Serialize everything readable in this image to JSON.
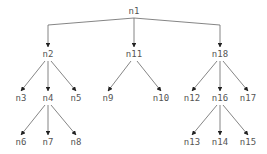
{
  "diagram": {
    "type": "tree",
    "colors": {
      "edge": "#666666",
      "label": "#555555",
      "background": "#ffffff"
    },
    "nodes": [
      {
        "id": "n1",
        "label": "n1",
        "x": 134,
        "y": 14
      },
      {
        "id": "n2",
        "label": "n2",
        "x": 48,
        "y": 57
      },
      {
        "id": "n11",
        "label": "n11",
        "x": 134,
        "y": 57
      },
      {
        "id": "n18",
        "label": "n18",
        "x": 220,
        "y": 57
      },
      {
        "id": "n3",
        "label": "n3",
        "x": 21,
        "y": 101
      },
      {
        "id": "n4",
        "label": "n4",
        "x": 48,
        "y": 101
      },
      {
        "id": "n5",
        "label": "n5",
        "x": 76,
        "y": 101
      },
      {
        "id": "n9",
        "label": "n9",
        "x": 108,
        "y": 101
      },
      {
        "id": "n10",
        "label": "n10",
        "x": 161,
        "y": 101
      },
      {
        "id": "n12",
        "label": "n12",
        "x": 192,
        "y": 101
      },
      {
        "id": "n16",
        "label": "n16",
        "x": 220,
        "y": 101
      },
      {
        "id": "n17",
        "label": "n17",
        "x": 248,
        "y": 101
      },
      {
        "id": "n6",
        "label": "n6",
        "x": 21,
        "y": 145
      },
      {
        "id": "n7",
        "label": "n7",
        "x": 48,
        "y": 145
      },
      {
        "id": "n8",
        "label": "n8",
        "x": 76,
        "y": 145
      },
      {
        "id": "n13",
        "label": "n13",
        "x": 192,
        "y": 145
      },
      {
        "id": "n14",
        "label": "n14",
        "x": 220,
        "y": 145
      },
      {
        "id": "n15",
        "label": "n15",
        "x": 248,
        "y": 145
      }
    ],
    "edges": [
      {
        "from": "n1",
        "to": "n2",
        "style": "elbow"
      },
      {
        "from": "n1",
        "to": "n11",
        "style": "straight"
      },
      {
        "from": "n1",
        "to": "n18",
        "style": "elbow"
      },
      {
        "from": "n2",
        "to": "n3"
      },
      {
        "from": "n2",
        "to": "n4"
      },
      {
        "from": "n2",
        "to": "n5"
      },
      {
        "from": "n4",
        "to": "n6"
      },
      {
        "from": "n4",
        "to": "n7"
      },
      {
        "from": "n4",
        "to": "n8"
      },
      {
        "from": "n11",
        "to": "n9"
      },
      {
        "from": "n11",
        "to": "n10"
      },
      {
        "from": "n18",
        "to": "n12"
      },
      {
        "from": "n18",
        "to": "n16"
      },
      {
        "from": "n18",
        "to": "n17"
      },
      {
        "from": "n16",
        "to": "n13"
      },
      {
        "from": "n16",
        "to": "n14"
      },
      {
        "from": "n16",
        "to": "n15"
      }
    ]
  }
}
